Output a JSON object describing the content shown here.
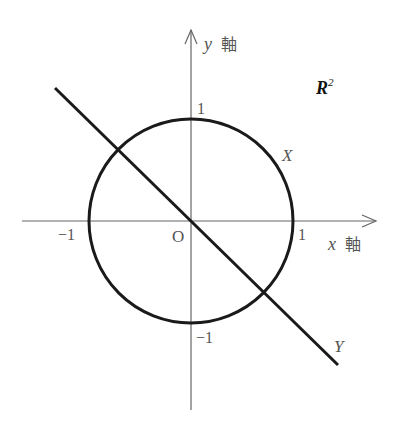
{
  "figure": {
    "space_label": "R",
    "space_superscript": "2",
    "x_axis_label": "x",
    "x_axis_suffix": "軸",
    "y_axis_label": "y",
    "y_axis_suffix": "軸",
    "origin_label": "O",
    "tick_labels": {
      "x_pos": "1",
      "x_neg": "−1",
      "y_pos": "1",
      "y_neg": "−1"
    },
    "circle_label": "X",
    "line_label": "Y"
  }
}
